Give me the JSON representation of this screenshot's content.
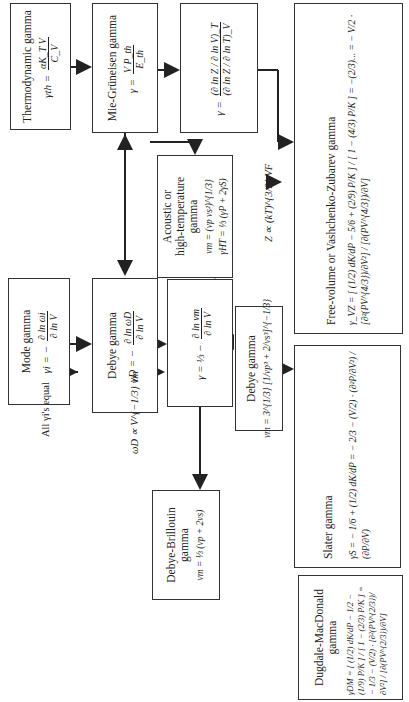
{
  "boxes": {
    "thermodynamic": {
      "title": "Thermodynamic gamma",
      "eq_lhs": "γth =",
      "eq_num": "αK_T V",
      "eq_den": "C_V"
    },
    "mie_gruneisen": {
      "title": "Mie-Grüneisen gamma",
      "eq_lhs": "γ =",
      "eq_num": "V P_th",
      "eq_den": "E_th"
    },
    "partition": {
      "eq_lhs": "γ =",
      "eq_num": "(∂ ln Z / ∂ ln V)_T",
      "eq_den": "(∂ ln Z / ∂ ln T)_V"
    },
    "free_volume": {
      "title": "Free-volume or Vashchenko-Zubarev gamma",
      "eq": "γ_VZ = [ (1/2) dK/dP − 5/6 + (2/9) P/K ] / [ 1 − (4/3) P/K ] = −(2/3)... = − V/2 · [∂²(PV^{4/3})/∂V²] / [∂(PV^{4/3})/∂V]"
    },
    "mode": {
      "title": "Mode gamma",
      "eq_lhs": "γi = −",
      "eq_num": "∂ ln ωi",
      "eq_den": "∂ ln V"
    },
    "debye": {
      "title": "Debye gamma",
      "eq_lhs": "γD = −",
      "eq_num": "∂ ln ωD",
      "eq_den": "∂ ln V"
    },
    "acoustic": {
      "title_line1": "Acoustic or",
      "title_line2": "high-temperature",
      "title_line3": "gamma",
      "eq1": "vm = (vp vs²)^{1/3}",
      "eq2": "γHT = ⅓ (γP + 2γS)"
    },
    "velocity": {
      "eq_lhs": "γ = ⅓ −",
      "eq_num": "∂ ln vm",
      "eq_den": "∂ ln V"
    },
    "debye_vm": {
      "title": "Debye gamma",
      "eq": "vm = 3^{1/3} [1/vp³ + 2/vs³]^{−1/3}"
    },
    "debye_brillouin": {
      "title_line1": "Debye-Brillouin",
      "title_line2": "gamma",
      "eq": "vm = ⅓ (vp + 2vs)"
    },
    "slater": {
      "title": "Slater gamma",
      "eq_a": "γS = − 1/6 + (1/2) dK/dP = − 2/3 − ",
      "eq_b": "(V/2) · (∂²P/∂V²) / (∂P/∂V)"
    },
    "dugdale": {
      "title": "Dugdale-MacDonald gamma",
      "eq": "γDM = [ (1/2) dK/dP − 1/2 − (1/9) P/K ] / [ 1 − (2/3) P/K ] = − 1/3 − (V/2) · [∂²(PV^{2/3})/∂V²] / [∂(PV^{2/3})/∂V]"
    }
  },
  "labels": {
    "all_equal": "All γi's equal",
    "omega_relation": "ωD ∝ V^{−1/3} vm",
    "z_relation": "Z ∝ (kT)^{3/2} VF"
  }
}
